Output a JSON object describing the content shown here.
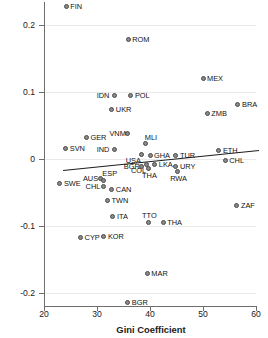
{
  "chart_data": {
    "type": "scatter",
    "title": "",
    "xlabel": "Gini Coefficient",
    "ylabel": "Prob. (good health): migrant - non-migrant",
    "xlim": [
      20,
      60
    ],
    "ylim": [
      -0.22,
      0.235
    ],
    "xticks": [
      20,
      30,
      40,
      50,
      60
    ],
    "xtick_labels": [
      "20",
      "30",
      "40",
      "50",
      "60"
    ],
    "yticks": [
      0.2,
      0.1,
      0,
      -0.1,
      -0.2
    ],
    "ytick_labels": [
      "0.2",
      "0.1",
      "0",
      "-0.1",
      "-0.2"
    ],
    "grid": "horizontal",
    "legend": "none",
    "marker_color": "#8a8a8a",
    "marker_edge_color": "#4a4a4a",
    "fit_line_color": "#1d1d1d",
    "gridline_color": "#e9e9e9",
    "axis_color": "#6e6e6e",
    "fit_line": {
      "x_start": 23.6,
      "y_start": -0.0165,
      "x_end": 60.6,
      "y_end": 0.0135
    },
    "points": [
      {
        "label": "FIN",
        "x": 24.2,
        "y": 0.228,
        "label_pos": "right"
      },
      {
        "label": "ROM",
        "x": 35.9,
        "y": 0.179,
        "label_pos": "right"
      },
      {
        "label": "MEX",
        "x": 50.0,
        "y": 0.1205,
        "label_pos": "right"
      },
      {
        "label": "IDN",
        "x": 33.3,
        "y": 0.0945,
        "label_pos": "left"
      },
      {
        "label": "POL",
        "x": 36.4,
        "y": 0.0945,
        "label_pos": "right"
      },
      {
        "label": "BRA",
        "x": 56.6,
        "y": 0.081,
        "label_pos": "right"
      },
      {
        "label": "UKR",
        "x": 32.8,
        "y": 0.0735,
        "label_pos": "right"
      },
      {
        "label": "ZMB",
        "x": 50.8,
        "y": 0.0685,
        "label_pos": "right"
      },
      {
        "label": "VNM",
        "x": 35.7,
        "y": 0.0375,
        "label_pos": "left"
      },
      {
        "label": "GER",
        "x": 28.0,
        "y": 0.0315,
        "label_pos": "right"
      },
      {
        "label": "MLI",
        "x": 39.2,
        "y": 0.0225,
        "label_pos": "above-right"
      },
      {
        "label": "SVN",
        "x": 24.1,
        "y": 0.016,
        "label_pos": "right"
      },
      {
        "label": "IND",
        "x": 33.3,
        "y": 0.014,
        "label_pos": "left"
      },
      {
        "label": "ETH",
        "x": 53.0,
        "y": 0.012,
        "label_pos": "right"
      },
      {
        "label": "USA",
        "x": 38.4,
        "y": 0.0075,
        "label_pos": "below-left"
      },
      {
        "label": "GHA",
        "x": 40.0,
        "y": 0.006,
        "label_pos": "right"
      },
      {
        "label": "TUR",
        "x": 44.9,
        "y": 0.0055,
        "label_pos": "right"
      },
      {
        "label": "CHL",
        "x": 54.2,
        "y": -0.0025,
        "label_pos": "right"
      },
      {
        "label": "COL",
        "x": 39.4,
        "y": -0.0075,
        "label_pos": "below-left"
      },
      {
        "label": "LKA",
        "x": 40.9,
        "y": -0.0075,
        "label_pos": "right"
      },
      {
        "label": "BGR",
        "x": 38.4,
        "y": -0.0115,
        "label_pos": "left"
      },
      {
        "label": "URY",
        "x": 44.9,
        "y": -0.0105,
        "label_pos": "right"
      },
      {
        "label": "THA",
        "x": 39.8,
        "y": -0.0145,
        "label_pos": "below"
      },
      {
        "label": "RWA",
        "x": 45.1,
        "y": -0.019,
        "label_pos": "below"
      },
      {
        "label": "AUS",
        "x": 30.7,
        "y": -0.0285,
        "label_pos": "left"
      },
      {
        "label": "ESP",
        "x": 31.2,
        "y": -0.032,
        "label_pos": "above-right"
      },
      {
        "label": "SWE",
        "x": 23.0,
        "y": -0.0365,
        "label_pos": "right"
      },
      {
        "label": "CHL",
        "x": 31.2,
        "y": -0.0415,
        "label_pos": "left"
      },
      {
        "label": "CAN",
        "x": 32.8,
        "y": -0.045,
        "label_pos": "right"
      },
      {
        "label": "TWN",
        "x": 32.0,
        "y": -0.0625,
        "label_pos": "right"
      },
      {
        "label": "ZAF",
        "x": 56.4,
        "y": -0.07,
        "label_pos": "right"
      },
      {
        "label": "ITA",
        "x": 33.0,
        "y": -0.0855,
        "label_pos": "right"
      },
      {
        "label": "TTO",
        "x": 39.8,
        "y": -0.095,
        "label_pos": "above"
      },
      {
        "label": "THA",
        "x": 42.5,
        "y": -0.095,
        "label_pos": "right"
      },
      {
        "label": "CYP",
        "x": 26.9,
        "y": -0.118,
        "label_pos": "right"
      },
      {
        "label": "KOR",
        "x": 31.3,
        "y": -0.116,
        "label_pos": "right"
      },
      {
        "label": "MAR",
        "x": 39.5,
        "y": -0.172,
        "label_pos": "right"
      },
      {
        "label": "BGR",
        "x": 35.8,
        "y": -0.2145,
        "label_pos": "right"
      }
    ]
  }
}
